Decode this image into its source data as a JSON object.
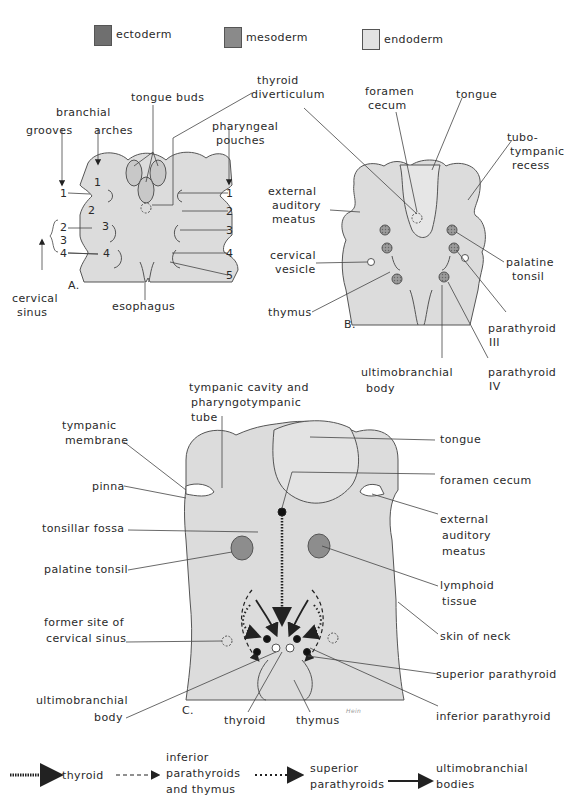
{
  "legend": {
    "items": [
      {
        "label": "ectoderm",
        "color": "#6f6f6f"
      },
      {
        "label": "mesoderm",
        "color": "#8a8a8a"
      },
      {
        "label": "endoderm",
        "color": "#e2e2e2"
      }
    ]
  },
  "panel_a": {
    "letter": "A.",
    "labels": {
      "branchial": "branchial",
      "grooves": "grooves",
      "arches": "arches",
      "tongue_buds": "tongue buds",
      "thyroid_diverticulum_1": "thyroid",
      "thyroid_diverticulum_2": "diverticulum",
      "pharyngeal_1": "pharyngeal",
      "pharyngeal_2": "pouches",
      "cervical_1": "cervical",
      "cervical_2": "sinus",
      "esophagus": "esophagus"
    },
    "left_numbers": [
      "1",
      "2",
      "3",
      "4"
    ],
    "arch_numbers": [
      "1",
      "2",
      "3",
      "4"
    ],
    "right_numbers": [
      "1",
      "2",
      "3",
      "4",
      "5"
    ]
  },
  "panel_b": {
    "letter": "B.",
    "labels": {
      "foramen_1": "foramen",
      "foramen_2": "cecum",
      "tongue": "tongue",
      "tubo_1": "tubo-",
      "tubo_2": "tympanic",
      "tubo_3": "recess",
      "ext_1": "external",
      "ext_2": "auditory",
      "ext_3": "meatus",
      "cerv_1": "cervical",
      "cerv_2": "vesicle",
      "palatine_1": "palatine",
      "palatine_2": "tonsil",
      "thymus": "thymus",
      "parathyroid_iii_1": "parathyroid",
      "parathyroid_iii_2": "III",
      "ultimo_1": "ultimobranchial",
      "ultimo_2": "body",
      "parathyroid_iv_1": "parathyroid",
      "parathyroid_iv_2": "IV"
    }
  },
  "panel_c": {
    "letter": "C.",
    "labels": {
      "tympanic_cavity_1": "tympanic cavity and",
      "tympanic_cavity_2": "pharyngotympanic",
      "tympanic_cavity_3": "tube",
      "tympanic_membrane_1": "tympanic",
      "tympanic_membrane_2": "membrane",
      "tongue": "tongue",
      "pinna": "pinna",
      "foramen_cecum": "foramen cecum",
      "tonsillar_fossa": "tonsillar fossa",
      "ext_1": "external",
      "ext_2": "auditory",
      "ext_3": "meatus",
      "palatine_tonsil": "palatine tonsil",
      "lymphoid_1": "lymphoid",
      "lymphoid_2": "tissue",
      "former_1": "former site of",
      "former_2": "cervical sinus",
      "skin_of_neck": "skin of neck",
      "superior_parathyroid": "superior parathyroid",
      "ultimo_1": "ultimobranchial",
      "ultimo_2": "body",
      "inferior_parathyroid": "inferior parathyroid",
      "thyroid": "thyroid",
      "thymus": "thymus",
      "signature": "Hein"
    }
  },
  "arrow_key": {
    "items": [
      {
        "style": "dense-dotted",
        "label_lines": [
          "thyroid"
        ]
      },
      {
        "style": "dashed",
        "label_lines": [
          "inferior",
          "parathyroids",
          "and thymus"
        ]
      },
      {
        "style": "dotted",
        "label_lines": [
          "superior",
          "parathyroids"
        ]
      },
      {
        "style": "solid",
        "label_lines": [
          "ultimobranchial",
          "bodies"
        ]
      }
    ]
  }
}
